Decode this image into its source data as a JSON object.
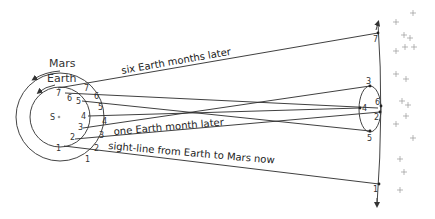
{
  "diagram": {
    "sun_label": "S",
    "planets": {
      "mars_label": "Mars",
      "earth_label": "Earth"
    },
    "captions": {
      "six_months": "six Earth months later",
      "one_month": "one Earth month later",
      "now": "sight-line from Earth to Mars now"
    },
    "earth_positions": [
      "1",
      "2",
      "3",
      "4",
      "5",
      "6",
      "7"
    ],
    "mars_positions": [
      "1",
      "2",
      "3",
      "4",
      "5",
      "6",
      "7"
    ],
    "sky_positions": [
      "1",
      "2",
      "3",
      "4",
      "5",
      "6",
      "7"
    ],
    "colors": {
      "line": "#2a2a2a",
      "star": "#999999",
      "background": "#ffffff"
    }
  }
}
